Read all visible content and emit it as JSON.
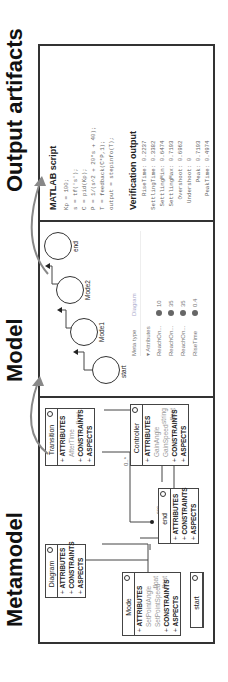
{
  "sections": {
    "metamodel": {
      "title": "Metamodel"
    },
    "model": {
      "title": "Model"
    },
    "output": {
      "title": "Output artifacts"
    }
  },
  "metamodel": {
    "classes": [
      {
        "name": "Diagram",
        "attributes": []
      },
      {
        "name": "Mode",
        "attributes": [
          {
            "name": "SetPointAngle",
            "type": "float"
          },
          {
            "name": "SetPointSpeed",
            "type": "float"
          }
        ]
      },
      {
        "name": "Transition",
        "attributes": [
          {
            "name": "AfterTime",
            "type": "float"
          }
        ]
      },
      {
        "name": "Controller",
        "attributes": [
          {
            "name": "GainAngle",
            "type": "string"
          },
          {
            "name": "GainSpeed",
            "type": "float"
          }
        ]
      },
      {
        "name": "end",
        "attributes": []
      },
      {
        "name": "start",
        "attributes": []
      }
    ],
    "sections": {
      "attributes": "ATTRIBUTES",
      "constraints": "CONSTRAINTS",
      "aspects": "ASPECTS"
    },
    "edge_labels": {
      "mult1": "0..*",
      "mult2": "0..*",
      "mult3": "0..*",
      "src": "src",
      "dst": "dst"
    }
  },
  "model": {
    "nodes": [
      "start",
      "Mode1",
      "Mode2",
      "end"
    ],
    "properties": {
      "header": {
        "col1": "Meta type",
        "col2": "Diagram"
      },
      "group": "▾ Attributes",
      "rows": [
        {
          "name": "ReachOn...",
          "value": "10"
        },
        {
          "name": "ReachOn...",
          "value": "35"
        },
        {
          "name": "ReachOn...",
          "value": "35"
        },
        {
          "name": "RiseTime",
          "value": "0.4"
        }
      ]
    }
  },
  "output": {
    "script_title": "MATLAB script",
    "script_lines": [
      "Kp = 100;",
      "s = tf('s');",
      "C = pid(Kp);",
      "P = 1/(s^2 + 20*s + 40);",
      "T = feedback(C*P,1);",
      "output = stepinfo(T);"
    ],
    "verification_title": "Verification output",
    "verification_lines": [
      "    RiseTime: 0.2237",
      "SettlingTime: 0.3382",
      " SettlingMin: 0.6474",
      " SettlingMax: 0.7193",
      "   Overshoot: 0.6962",
      "  Undershoot: 0",
      "        Peak: 0.7193",
      "    PeakTime: 0.4974"
    ]
  }
}
